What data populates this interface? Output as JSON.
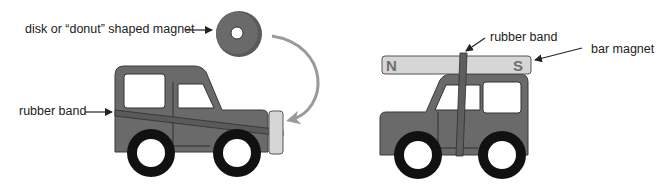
{
  "left_panel": {
    "disk_label": "disk or “donut” shaped magnet",
    "band_label": "rubber band"
  },
  "right_panel": {
    "band_label": "rubber band",
    "bar_label": "bar magnet",
    "pole_n": "N",
    "pole_s": "S"
  },
  "colors": {
    "body": "#6a6a6a",
    "outline": "#2e2e2e",
    "window": "#ffffff",
    "magnet_bar": "#d6d6d6",
    "arrow_curve": "#9a9a9a",
    "tire": "#111111"
  }
}
